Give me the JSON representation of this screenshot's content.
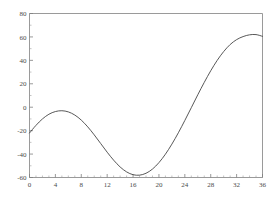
{
  "chart_data": {
    "type": "line",
    "title": "",
    "subtitle": "",
    "xlabel": "",
    "ylabel": "",
    "xlim": [
      0,
      36
    ],
    "ylim": [
      -60,
      80
    ],
    "grid": false,
    "legend": null,
    "x_ticks": [
      0,
      4,
      8,
      12,
      16,
      20,
      24,
      28,
      32,
      36
    ],
    "x_tick_labels": [
      "0",
      "4",
      "8",
      "12",
      "16",
      "20",
      "24",
      "28",
      "32",
      "36"
    ],
    "x_minor_tick_step": 1,
    "y_ticks": [
      -60,
      -40,
      -20,
      0,
      20,
      40,
      60,
      80
    ],
    "y_tick_labels": [
      "-60",
      "-40",
      "-20",
      "0",
      "20",
      "40",
      "60",
      "80"
    ],
    "y_minor_tick_step": 10,
    "line_color": "#454545",
    "axis_color": "#808080",
    "background_color": "#ffffff",
    "annotations": [],
    "series": [
      {
        "name": "curve",
        "x": [
          0,
          1,
          2,
          3,
          4,
          5,
          6,
          7,
          8,
          9,
          10,
          11,
          12,
          13,
          14,
          15,
          16,
          17,
          18,
          19,
          20,
          21,
          22,
          23,
          24,
          25,
          26,
          27,
          28,
          29,
          30,
          31,
          32,
          33,
          34,
          35,
          36
        ],
        "values": [
          -22,
          -15.5,
          -10,
          -6,
          -3.7,
          -3,
          -4,
          -6.7,
          -11,
          -16.8,
          -23.6,
          -31,
          -38.4,
          -45.2,
          -51,
          -55.2,
          -57.6,
          -58,
          -56.4,
          -52.8,
          -47.3,
          -40.1,
          -31.5,
          -21.8,
          -11.3,
          -0.4,
          10.6,
          21.2,
          31.1,
          40,
          47.5,
          53.5,
          57.7,
          60.3,
          61.8,
          62,
          60.5
        ],
        "local_max_x": 5,
        "local_max_y": -3,
        "global_min_x": 15.5,
        "global_min_y": -58,
        "global_max_x": 29,
        "global_max_y": 62,
        "start_point": [
          0,
          -22
        ],
        "end_point": [
          36,
          18
        ]
      }
    ]
  },
  "figure": {
    "width": 277,
    "height": 199
  }
}
